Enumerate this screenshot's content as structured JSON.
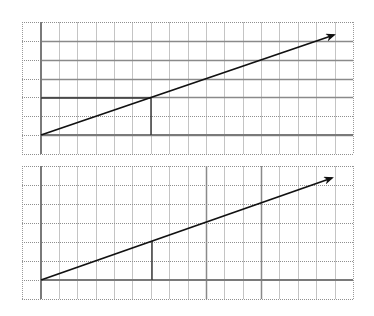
{
  "figure": {
    "colors": {
      "background": "#ffffff",
      "grid": "#c4c4c4",
      "grid_dotted": "#9a9a9a",
      "axis": "#7a7a7a",
      "vector": "#111111",
      "guide": "#333333"
    },
    "panels": [
      {
        "id": "top",
        "bounds": {
          "x": 22,
          "y": 22,
          "width": 331,
          "height": 132
        },
        "columns": 18,
        "rows": 7,
        "origin": {
          "x": 41,
          "y": 135
        },
        "vector_tip": {
          "x": 334,
          "y": 35
        },
        "marked_point": {
          "x": 151,
          "y": 98
        },
        "guides": [
          "horizontal from axis to marked point",
          "vertical from marked point to baseline"
        ],
        "solid_horizontal_rows_y": [
          41,
          60,
          79,
          98,
          135
        ]
      },
      {
        "id": "bottom",
        "bounds": {
          "x": 22,
          "y": 166,
          "width": 331,
          "height": 133
        },
        "columns": 18,
        "rows": 7,
        "origin": {
          "x": 41,
          "y": 280
        },
        "vector_tip": {
          "x": 332,
          "y": 178
        },
        "marked_point": {
          "x": 152,
          "y": 241
        },
        "guides": [
          "vertical from marked point to baseline"
        ],
        "solid_vertical_cols_x": [
          207,
          263
        ]
      }
    ]
  }
}
